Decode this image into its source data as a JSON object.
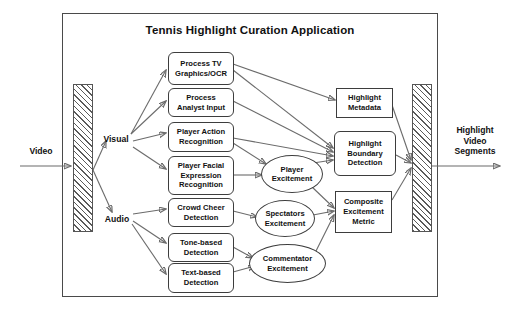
{
  "diagram": {
    "title": "Tennis Highlight Curation Application",
    "type": "flowchart",
    "input": {
      "label": "Video"
    },
    "output": {
      "label": "Highlight\nVideo\nSegments"
    },
    "branches": [
      {
        "id": "visual",
        "label": "Visual"
      },
      {
        "id": "audio",
        "label": "Audio"
      }
    ],
    "processes": [
      {
        "id": "process-tv-graphics-ocr",
        "label": "Process TV\nGraphics/OCR",
        "shape": "rounded-rect",
        "branch": "visual"
      },
      {
        "id": "process-analyst-input",
        "label": "Process\nAnalyst Input",
        "shape": "rounded-rect",
        "branch": "visual"
      },
      {
        "id": "player-action-recognition",
        "label": "Player Action\nRecognition",
        "shape": "rounded-rect",
        "branch": "visual"
      },
      {
        "id": "player-facial-expression-recognition",
        "label": "Player Facial\nExpression\nRecognition",
        "shape": "rounded-rect",
        "branch": "visual"
      },
      {
        "id": "crowd-cheer-detection",
        "label": "Crowd Cheer\nDetection",
        "shape": "rounded-rect",
        "branch": "audio"
      },
      {
        "id": "tone-based-detection",
        "label": "Tone-based\nDetection",
        "shape": "rounded-rect",
        "branch": "audio"
      },
      {
        "id": "text-based-detection",
        "label": "Text-based\nDetection",
        "shape": "rounded-rect",
        "branch": "audio"
      }
    ],
    "excitement_nodes": [
      {
        "id": "player-excitement",
        "label": "Player\nExcitement",
        "shape": "ellipse"
      },
      {
        "id": "spectators-excitement",
        "label": "Spectators\nExcitement",
        "shape": "ellipse"
      },
      {
        "id": "commentator-excitement",
        "label": "Commentator\nExcitement",
        "shape": "ellipse"
      }
    ],
    "outputs": [
      {
        "id": "highlight-metadata",
        "label": "Highlight\nMetadata",
        "shape": "rect"
      },
      {
        "id": "highlight-boundary-detection",
        "label": "Highlight\nBoundary\nDetection",
        "shape": "rounded-rect"
      },
      {
        "id": "composite-excitement-metric",
        "label": "Composite\nExcitement\nMetric",
        "shape": "rect"
      }
    ],
    "bars": [
      {
        "id": "input-splitter-bar",
        "pattern": "hatched"
      },
      {
        "id": "output-merger-bar",
        "pattern": "hatched"
      }
    ],
    "colors": {
      "frame": "#4a4a4a",
      "node_border": "#3d3d3d",
      "edge": "#6b6b6b",
      "text": "#111111",
      "background": "#ffffff"
    }
  }
}
